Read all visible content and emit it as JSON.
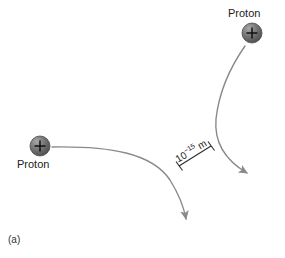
{
  "figure": {
    "panel_label": "(a)",
    "background_color": "#ffffff",
    "particles": [
      {
        "id": "proton-top",
        "label": "Proton",
        "charge_symbol": "+",
        "cx": 252,
        "cy": 33,
        "r": 10,
        "body_color": "#6e6e6e",
        "edge_color": "#4a4a4a",
        "highlight_color": "#a8a8a8"
      },
      {
        "id": "proton-left",
        "label": "Proton",
        "charge_symbol": "+",
        "cx": 40,
        "cy": 146,
        "r": 10,
        "body_color": "#6e6e6e",
        "edge_color": "#4a4a4a",
        "highlight_color": "#a8a8a8"
      }
    ],
    "trajectories": [
      {
        "id": "trajectory-left-proton",
        "description": "incoming from left, deflected downward",
        "stroke_color": "#8a8a8a",
        "stroke_width": 1.4,
        "arrow_direction": "down"
      },
      {
        "id": "trajectory-top-proton",
        "description": "incoming from top, deflected down-right",
        "stroke_color": "#8a8a8a",
        "stroke_width": 1.4,
        "arrow_direction": "down-right"
      }
    ],
    "scale_bar": {
      "label_mantissa": "10",
      "label_exponent": "−15",
      "label_unit": "m",
      "value_text": "10−15 m",
      "rotation_deg": -31,
      "stroke_color": "#2b2b2b"
    }
  }
}
